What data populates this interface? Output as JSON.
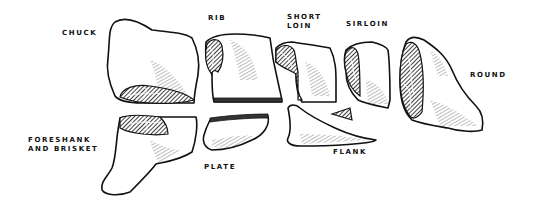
{
  "diagram": {
    "style": "engraved line illustration, black on white",
    "colors": {
      "background": "#ffffff",
      "ink": "#111111"
    },
    "labels": [
      {
        "id": "chuck",
        "text": "CHUCK",
        "lines": [
          "CHUCK"
        ]
      },
      {
        "id": "rib",
        "text": "RIB",
        "lines": [
          "RIB"
        ]
      },
      {
        "id": "short-loin",
        "text": "SHORT LOIN",
        "lines": [
          "SHORT",
          "LOIN"
        ]
      },
      {
        "id": "sirloin",
        "text": "SIRLOIN",
        "lines": [
          "SIRLOIN"
        ]
      },
      {
        "id": "round",
        "text": "ROUND",
        "lines": [
          "ROUND"
        ]
      },
      {
        "id": "foreshank-and-brisket",
        "text": "FORESHANK AND BRISKET",
        "lines": [
          "FORESHANK",
          "AND BRISKET"
        ]
      },
      {
        "id": "plate",
        "text": "PLATE",
        "lines": [
          "PLATE"
        ]
      },
      {
        "id": "flank",
        "text": "FLANK",
        "lines": [
          "FLANK"
        ]
      }
    ]
  }
}
